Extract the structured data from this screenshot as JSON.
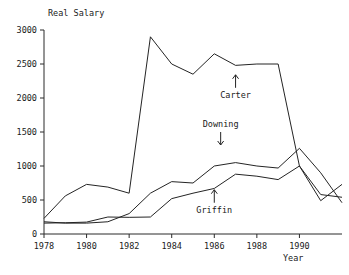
{
  "chart_data": {
    "type": "line",
    "title": "",
    "ylabel": "Real Salary",
    "xlabel": "Year",
    "xlim": [
      1978,
      1992
    ],
    "ylim": [
      0,
      3000
    ],
    "grid": false,
    "legend_position": "inline-annotations",
    "x": [
      1978,
      1979,
      1980,
      1981,
      1982,
      1983,
      1984,
      1985,
      1986,
      1987,
      1988,
      1989,
      1990,
      1991,
      1992
    ],
    "xtick_labels": [
      "1978",
      "1980",
      "1982",
      "1984",
      "1986",
      "1988",
      "1990"
    ],
    "xtick_values": [
      1978,
      1980,
      1982,
      1984,
      1986,
      1988,
      1990
    ],
    "ytick_labels": [
      "0",
      "500",
      "1000",
      "1500",
      "2000",
      "2500",
      "3000"
    ],
    "ytick_values": [
      0,
      500,
      1000,
      1500,
      2000,
      2500,
      3000
    ],
    "series": [
      {
        "name": "Carter",
        "values": [
          230,
          560,
          730,
          690,
          600,
          2900,
          2500,
          2350,
          2650,
          2480,
          2500,
          2500,
          1000,
          490,
          730
        ]
      },
      {
        "name": "Downing",
        "values": [
          180,
          160,
          160,
          180,
          300,
          600,
          770,
          750,
          1000,
          1050,
          1000,
          970,
          1260,
          900,
          460
        ]
      },
      {
        "name": "Griffin",
        "values": [
          160,
          165,
          175,
          250,
          245,
          250,
          520,
          600,
          670,
          880,
          850,
          800,
          1000,
          580,
          540
        ]
      }
    ],
    "annotations": [
      {
        "label": "Carter",
        "arrow": "up",
        "x": 1987.0,
        "y": 2150
      },
      {
        "label": "Downing",
        "arrow": "down",
        "x": 1986.3,
        "y": 1500
      },
      {
        "label": "Griffin",
        "arrow": "up",
        "x": 1986.0,
        "y": 460
      }
    ]
  },
  "footer": {
    "caption": ""
  }
}
